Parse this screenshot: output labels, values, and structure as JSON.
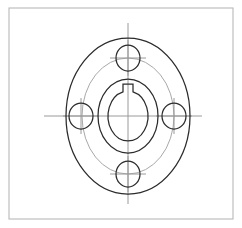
{
  "page": {
    "width": 242,
    "height": 228,
    "background_color": "#ffffff"
  },
  "frame": {
    "name": "drawing-border",
    "x": 9,
    "y": 8,
    "width": 224,
    "height": 211,
    "stroke_color": "#b8b8b8",
    "stroke_width": 1.1,
    "fill": "none"
  },
  "colors": {
    "object_line": "#2b2b2b",
    "center_line": "#9a9a9a",
    "bolt_circle": "#a8a8a8",
    "frame": "#b8b8b8",
    "background": "#ffffff"
  },
  "part": {
    "type": "flange-coupling",
    "view": "front-elevation",
    "center_x": 128,
    "center_y": 116
  },
  "outer_flange": {
    "name": "outer-flange-ellipse",
    "cx": 128,
    "cy": 116,
    "rx": 62,
    "ry": 78,
    "stroke_color": "#2b2b2b",
    "stroke_width": 1.25
  },
  "bolt_circle": {
    "name": "bolt-circle",
    "cx": 128,
    "cy": 116,
    "rx": 46,
    "ry": 58,
    "stroke_color": "#a8a8a8",
    "stroke_width": 1.0
  },
  "hub": {
    "name": "hub-ellipse",
    "cx": 128,
    "cy": 116,
    "rx": 30,
    "ry": 37,
    "stroke_color": "#2b2b2b",
    "stroke_width": 1.25
  },
  "bore": {
    "name": "center-bore-ellipse",
    "cx": 128,
    "cy": 116,
    "rx": 20,
    "ry": 25,
    "stroke_color": "#2b2b2b",
    "stroke_width": 1.25
  },
  "keyway": {
    "name": "keyway-slot",
    "half_width": 5,
    "top_y": 84,
    "bottom_y": 93,
    "stroke_color": "#2b2b2b",
    "stroke_width": 1.25
  },
  "bolt_holes": [
    {
      "name": "bolt-hole-top",
      "position": "top",
      "cx": 128,
      "cy": 58,
      "rx": 12,
      "ry": 13,
      "stroke_color": "#2b2b2b",
      "stroke_width": 1.25
    },
    {
      "name": "bolt-hole-right",
      "position": "right",
      "cx": 174,
      "cy": 116,
      "rx": 12,
      "ry": 13,
      "stroke_color": "#2b2b2b",
      "stroke_width": 1.25
    },
    {
      "name": "bolt-hole-bottom",
      "position": "bottom",
      "cx": 128,
      "cy": 174,
      "rx": 12,
      "ry": 13,
      "stroke_color": "#2b2b2b",
      "stroke_width": 1.25
    },
    {
      "name": "bolt-hole-left",
      "position": "left",
      "cx": 81,
      "cy": 116,
      "rx": 12,
      "ry": 13,
      "stroke_color": "#2b2b2b",
      "stroke_width": 1.25
    }
  ],
  "center_lines": {
    "stroke_color": "#9a9a9a",
    "stroke_width": 1.0,
    "main_vertical": {
      "name": "main-vertical-centerline",
      "x": 128,
      "y1": 23,
      "y2": 204
    },
    "main_horizontal": {
      "name": "main-horizontal-centerline",
      "y": 116,
      "x1": 44,
      "x2": 202
    },
    "bolt_hole_marks": [
      {
        "name": "center-mark-top",
        "cx": 128,
        "cy": 58,
        "h_half": 18,
        "v_half": 18
      },
      {
        "name": "center-mark-right",
        "cx": 174,
        "cy": 116,
        "h_half": 18,
        "v_half": 18
      },
      {
        "name": "center-mark-bottom",
        "cx": 128,
        "cy": 174,
        "h_half": 18,
        "v_half": 18
      },
      {
        "name": "center-mark-left",
        "cx": 81,
        "cy": 116,
        "h_half": 18,
        "v_half": 18
      }
    ]
  }
}
